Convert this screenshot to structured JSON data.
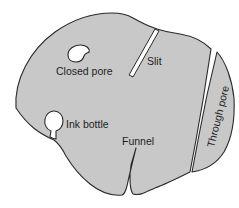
{
  "diagram": {
    "labels": {
      "closed_pore": "Closed pore",
      "slit": "Slit",
      "ink_bottle": "Ink bottle",
      "funnel": "Funnel",
      "through_pore": "Through pore"
    },
    "colors": {
      "solid_fill": "#c8c8c8",
      "outline": "#2a2a2a",
      "pore_fill": "#ffffff",
      "text": "#1e1e1e"
    }
  }
}
